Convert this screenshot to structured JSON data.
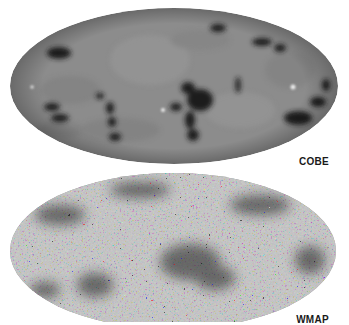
{
  "figure": {
    "background": "#ffffff",
    "maps": [
      {
        "id": "cobe",
        "label": "COBE",
        "projection": "mollweide-ellipse",
        "base_color": "#8c8c8c",
        "anomaly_color": "#1c1c1c",
        "hotspot_color": "#e6e6e6"
      },
      {
        "id": "wmap",
        "label": "WMAP",
        "projection": "mollweide-ellipse",
        "base_color": "#8a8a8a",
        "speckle_dark": "#202020",
        "speckle_light": "#d8d8d8"
      }
    ]
  }
}
